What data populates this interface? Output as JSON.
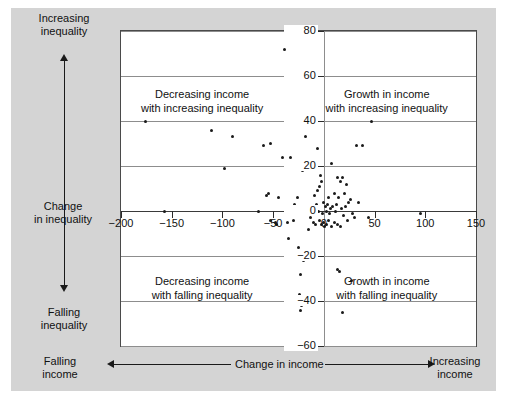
{
  "chart_data": {
    "type": "scatter",
    "title": "",
    "xlabel": "Change in income",
    "ylabel": "Change in inequality",
    "xlim": [
      -200,
      150
    ],
    "ylim": [
      -60,
      80
    ],
    "grid": true,
    "legend": null,
    "xticks": [
      "−200",
      "−150",
      "−100",
      "−50",
      "0",
      "50",
      "100",
      "150"
    ],
    "xtick_values": [
      -200,
      -150,
      -100,
      -50,
      0,
      50,
      100,
      150
    ],
    "yticks": [
      "80",
      "60",
      "40",
      "20",
      "0",
      "−20",
      "−40",
      "−60"
    ],
    "ytick_values": [
      80,
      60,
      40,
      20,
      0,
      -20,
      -40,
      -60
    ],
    "axis_arrow_labels": {
      "y_top": "Increasing\ninequality",
      "y_bottom": "Falling\ninequality",
      "x_left": "Falling\nincome",
      "x_right": "Increasing\nincome"
    },
    "quadrant_annotations": [
      {
        "id": "top-left",
        "line1": "Decreasing income",
        "line2": "with increasing inequality"
      },
      {
        "id": "top-right",
        "line1": "Growth in income",
        "line2": "with increasing inequality"
      },
      {
        "id": "bottom-left",
        "line1": "Decreasing income",
        "line2": "with falling inequality"
      },
      {
        "id": "bottom-right",
        "line1": "Growth in income",
        "line2": "with falling inequality"
      }
    ],
    "points": [
      [
        -39,
        72
      ],
      [
        -176,
        40
      ],
      [
        47,
        40
      ],
      [
        -111,
        36
      ],
      [
        -90,
        33
      ],
      [
        -18,
        33
      ],
      [
        -53,
        30
      ],
      [
        -60,
        29
      ],
      [
        32,
        29
      ],
      [
        38,
        29
      ],
      [
        -6,
        28
      ],
      [
        -41,
        24
      ],
      [
        -33,
        24
      ],
      [
        -98,
        19
      ],
      [
        -21,
        18
      ],
      [
        8,
        21
      ],
      [
        -3,
        16
      ],
      [
        13,
        15
      ],
      [
        18,
        15
      ],
      [
        -2,
        13
      ],
      [
        16,
        13
      ],
      [
        -4,
        11
      ],
      [
        22,
        12
      ],
      [
        -6,
        9
      ],
      [
        10,
        8
      ],
      [
        -57,
        7
      ],
      [
        -55,
        8
      ],
      [
        -45,
        6
      ],
      [
        -26,
        6
      ],
      [
        -9,
        7
      ],
      [
        5,
        6
      ],
      [
        14,
        6
      ],
      [
        20,
        8
      ],
      [
        26,
        5
      ],
      [
        -30,
        2
      ],
      [
        -29,
        3
      ],
      [
        -7,
        3
      ],
      [
        0,
        4
      ],
      [
        2,
        2
      ],
      [
        4,
        3
      ],
      [
        7,
        1
      ],
      [
        9,
        2
      ],
      [
        12,
        3
      ],
      [
        17,
        1
      ],
      [
        21,
        2
      ],
      [
        24,
        4
      ],
      [
        34,
        4
      ],
      [
        -157,
        0
      ],
      [
        -64,
        0
      ],
      [
        -5,
        0
      ],
      [
        -1,
        -1
      ],
      [
        3,
        0
      ],
      [
        6,
        -1
      ],
      [
        11,
        0
      ],
      [
        19,
        -2
      ],
      [
        28,
        -1
      ],
      [
        95,
        -1
      ],
      [
        -53,
        -4
      ],
      [
        -48,
        -5
      ],
      [
        -47,
        -6
      ],
      [
        -36,
        -5
      ],
      [
        -30,
        -4
      ],
      [
        -13,
        -3
      ],
      [
        -10,
        -5
      ],
      [
        -8,
        -6
      ],
      [
        -4,
        -4
      ],
      [
        -2,
        -6
      ],
      [
        0,
        -5
      ],
      [
        1,
        -7
      ],
      [
        3,
        -6
      ],
      [
        5,
        -4
      ],
      [
        8,
        -7
      ],
      [
        10,
        -5
      ],
      [
        13,
        -6
      ],
      [
        16,
        -7
      ],
      [
        23,
        -4
      ],
      [
        30,
        -3
      ],
      [
        44,
        -3
      ],
      [
        -35,
        -12
      ],
      [
        -15,
        -8
      ],
      [
        -25,
        -16
      ],
      [
        -20,
        -22
      ],
      [
        -23,
        -28
      ],
      [
        13,
        -26
      ],
      [
        15,
        -27
      ],
      [
        27,
        -31
      ],
      [
        -24,
        -37
      ],
      [
        -22,
        -42
      ],
      [
        -23,
        -44
      ],
      [
        18,
        -45
      ]
    ]
  }
}
